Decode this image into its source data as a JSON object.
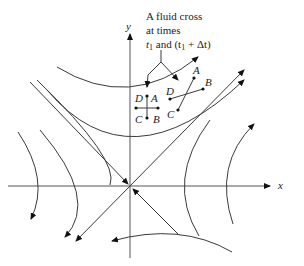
{
  "diagram": {
    "annotation": {
      "line1": "A fluid cross",
      "line2": "at times",
      "line3_prefix": "t",
      "line3_sub1": "1",
      "line3_mid": " and (t",
      "line3_sub2": "1",
      "line3_suffix": " + Δt)"
    },
    "axes": {
      "x_label": "x",
      "y_label": "y"
    },
    "cross_initial": {
      "points": [
        "A",
        "B",
        "C",
        "D"
      ]
    },
    "cross_later": {
      "points": [
        "A",
        "B",
        "C",
        "D"
      ]
    },
    "colors": {
      "line": "#3a3a3a",
      "axis": "#555555",
      "text": "#222222",
      "background": "#ffffff"
    }
  }
}
